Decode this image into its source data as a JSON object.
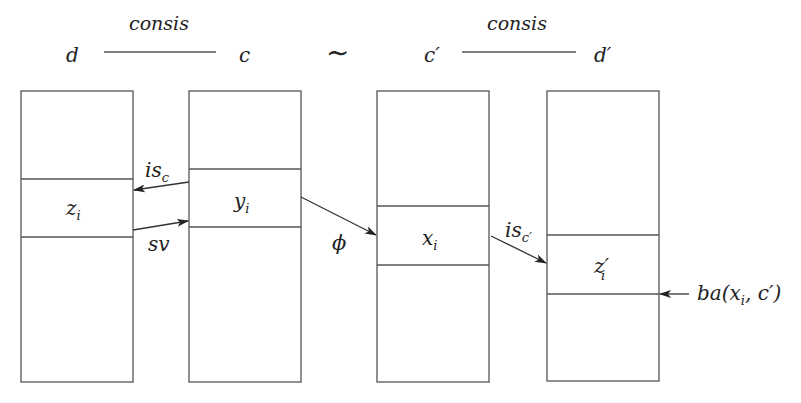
{
  "header": {
    "left_pair": {
      "left": "d",
      "right": "c",
      "relation": "consis"
    },
    "equiv_symbol": "∼",
    "right_pair": {
      "left": "c′",
      "right": "d′",
      "relation": "consis"
    }
  },
  "columns": [
    {
      "id": "d",
      "cell_label": "z",
      "cell_sub": "i"
    },
    {
      "id": "c",
      "cell_label": "y",
      "cell_sub": "i"
    },
    {
      "id": "c′",
      "cell_label": "x",
      "cell_sub": "i"
    },
    {
      "id": "d′",
      "cell_label": "z′",
      "cell_sub": "i"
    }
  ],
  "arrows": {
    "is_c": {
      "label": "is",
      "sub": "c"
    },
    "sv": {
      "label": "sv"
    },
    "phi": {
      "label": "ϕ"
    },
    "is_c_prime": {
      "label": "is",
      "sub": "c′"
    },
    "ba": {
      "label": "ba(x",
      "sub": "i",
      "rest": ", c′)"
    }
  }
}
